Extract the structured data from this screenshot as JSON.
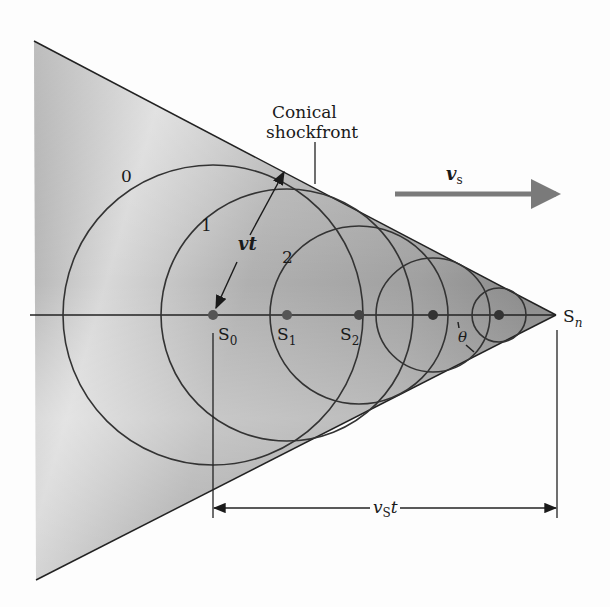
{
  "diagram": {
    "title": "Conical shockfront",
    "labels": {
      "shockfront_line1": "Conical",
      "shockfront_line2": "shockfront",
      "wavefront_0": "0",
      "wavefront_1": "1",
      "wavefront_2": "2",
      "radius_label": "vt",
      "source_velocity_label": "v",
      "source_velocity_sub": "s",
      "source_0": "S",
      "source_0_sub": "0",
      "source_1": "S",
      "source_1_sub": "1",
      "source_2": "S",
      "source_2_sub": "2",
      "source_n": "S",
      "source_n_sub": "n",
      "angle_label": "θ",
      "distance_label_v": "v",
      "distance_label_sub": "S",
      "distance_label_t": "t"
    },
    "colors": {
      "line": "#2a2a2a",
      "cone_fill_dark": "#8c8c8c",
      "cone_fill_light": "#e6e6e6",
      "arrow": "#7a7a7a",
      "dot": "#333333"
    }
  }
}
